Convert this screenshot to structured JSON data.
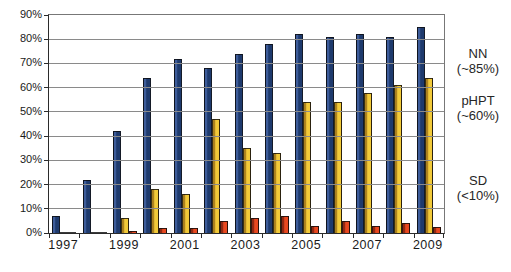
{
  "chart_data": {
    "type": "bar",
    "title": "",
    "xlabel": "",
    "ylabel": "",
    "categories": [
      "1997",
      "1998",
      "1999",
      "2000",
      "2001",
      "2002",
      "2003",
      "2004",
      "2005",
      "2006",
      "2007",
      "2008",
      "2009"
    ],
    "series": [
      {
        "name": "NN",
        "color": "#1e3a6d",
        "edge_color": "#3e5d9b",
        "values": [
          7,
          22,
          42,
          64,
          72,
          68,
          74,
          78,
          82,
          81,
          82,
          81,
          85
        ]
      },
      {
        "name": "pHPT",
        "color": "#f2ca39",
        "edge_color": "#a97f1e",
        "values": [
          0.3,
          0.3,
          6,
          18,
          16,
          47,
          35,
          33,
          54,
          54,
          58,
          61,
          64
        ]
      },
      {
        "name": "SD",
        "color": "#e8481f",
        "edge_color": "#8e2812",
        "values": [
          0.5,
          0.5,
          1,
          2,
          2,
          5,
          6,
          7,
          3,
          5,
          3,
          4,
          2.5
        ]
      }
    ],
    "ylim": [
      0,
      90
    ],
    "ytick_step": 10,
    "ytick_labels": [
      "0%",
      "10%",
      "20%",
      "30%",
      "40%",
      "50%",
      "60%",
      "70%",
      "80%",
      "90%"
    ],
    "xtick_labels": [
      "1997",
      "1999",
      "2001",
      "2003",
      "2005",
      "2007",
      "2009"
    ],
    "grid": true,
    "legend_position": "right",
    "annotations": [
      {
        "line1": "NN",
        "line2": "(~85%)"
      },
      {
        "line1": "pHPT",
        "line2": "(~60%)"
      },
      {
        "line1": "SD",
        "line2": "(<10%)"
      }
    ]
  },
  "colors": {
    "background": "#ffffff",
    "gridline": "#8a8a8a",
    "axis": "#2b2b2b",
    "text": "#1a1a1a"
  }
}
